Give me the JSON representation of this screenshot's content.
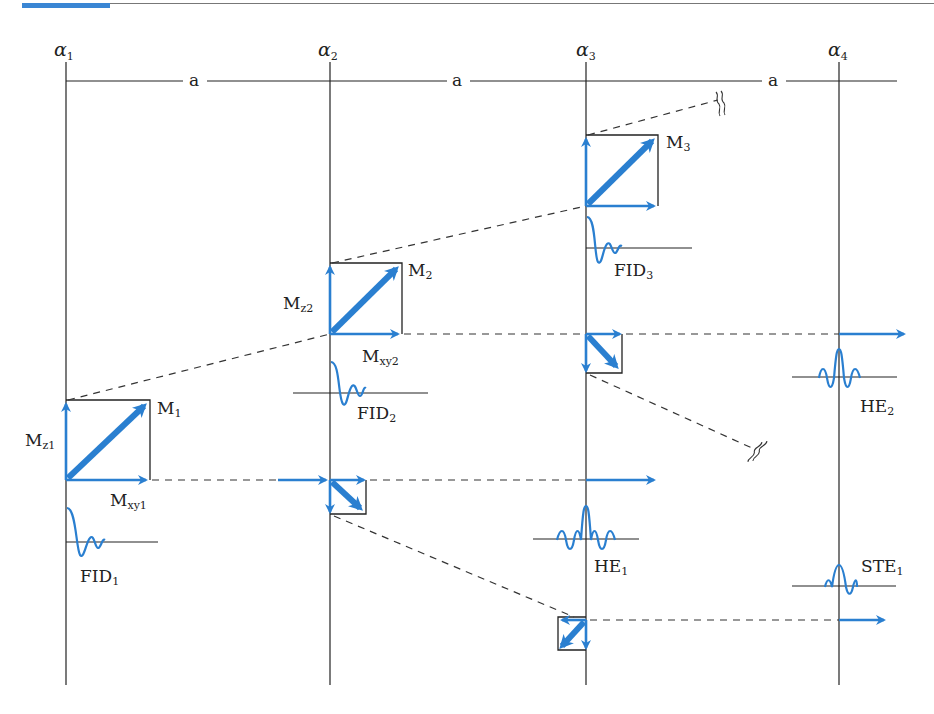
{
  "figure": {
    "type": "spin-echo pulse sequence diagram",
    "accent_color": "#3a86d4",
    "vector_color": "#2a7fd0",
    "line_color": "#222222"
  },
  "pulses": [
    {
      "id": "alpha1",
      "symbol": "α",
      "sub": "1"
    },
    {
      "id": "alpha2",
      "symbol": "α",
      "sub": "2"
    },
    {
      "id": "alpha3",
      "symbol": "α",
      "sub": "3"
    },
    {
      "id": "alpha4",
      "symbol": "α",
      "sub": "4"
    }
  ],
  "intervals": [
    {
      "label": "a"
    },
    {
      "label": "a"
    },
    {
      "label": "a"
    }
  ],
  "magnetization": {
    "m1": {
      "main": "M",
      "sub": "1"
    },
    "mz1": {
      "main": "M",
      "sub": "z1"
    },
    "mxy1": {
      "main": "M",
      "sub": "xy1"
    },
    "m2": {
      "main": "M",
      "sub": "2"
    },
    "mz2": {
      "main": "M",
      "sub": "z2"
    },
    "mxy2": {
      "main": "M",
      "sub": "xy2"
    },
    "m3": {
      "main": "M",
      "sub": "3"
    }
  },
  "signals": {
    "fid1": {
      "main": "FID",
      "sub": "1"
    },
    "fid2": {
      "main": "FID",
      "sub": "2"
    },
    "fid3": {
      "main": "FID",
      "sub": "3"
    },
    "he1": {
      "main": "HE",
      "sub": "1"
    },
    "he2": {
      "main": "HE",
      "sub": "2"
    },
    "ste1": {
      "main": "STE",
      "sub": "1"
    }
  }
}
